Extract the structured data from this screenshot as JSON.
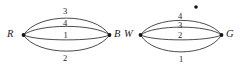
{
  "figure": {
    "type": "multigraph-pair",
    "background_color": "#ffffff",
    "stroke_color": "#2b2b2b",
    "text_color": "#262626"
  },
  "graphs": [
    {
      "id": "left-graph",
      "vertices": [
        {
          "id": "R",
          "label": "R",
          "side": "left"
        },
        {
          "id": "B",
          "label": "B",
          "side": "right"
        }
      ],
      "edge_labels_top_to_bottom": [
        "3",
        "4",
        "1",
        "2"
      ],
      "edges": [
        {
          "label": "3",
          "position": "outer-top"
        },
        {
          "label": "4",
          "position": "inner-top"
        },
        {
          "label": "1",
          "position": "inner-bottom"
        },
        {
          "label": "2",
          "position": "outer-bottom"
        }
      ]
    },
    {
      "id": "right-graph",
      "vertices": [
        {
          "id": "W",
          "label": "W",
          "side": "left"
        },
        {
          "id": "G",
          "label": "G",
          "side": "right"
        }
      ],
      "edge_labels_top_to_bottom": [
        "4",
        "3",
        "2",
        "1"
      ],
      "edges": [
        {
          "label": "4",
          "position": "outer-top"
        },
        {
          "label": "3",
          "position": "inner-top"
        },
        {
          "label": "2",
          "position": "inner-bottom"
        },
        {
          "label": "1",
          "position": "outer-bottom"
        }
      ]
    }
  ],
  "marks": {
    "stray_dot": "•"
  }
}
